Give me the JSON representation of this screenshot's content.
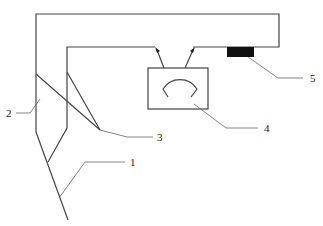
{
  "diagram": {
    "title": "",
    "labels": {
      "l1": "1",
      "l2": "2",
      "l3": "3",
      "l4": "4",
      "l5": "5"
    },
    "components": [
      {
        "id": "1",
        "name": "lower-junction-pipe"
      },
      {
        "id": "2",
        "name": "outer-pipe"
      },
      {
        "id": "3",
        "name": "crossing-branch"
      },
      {
        "id": "4",
        "name": "gauge-meter"
      },
      {
        "id": "5",
        "name": "black-block-sensor"
      }
    ],
    "colors": {
      "line": "#444444",
      "block": "#111111",
      "background": "#ffffff"
    }
  }
}
